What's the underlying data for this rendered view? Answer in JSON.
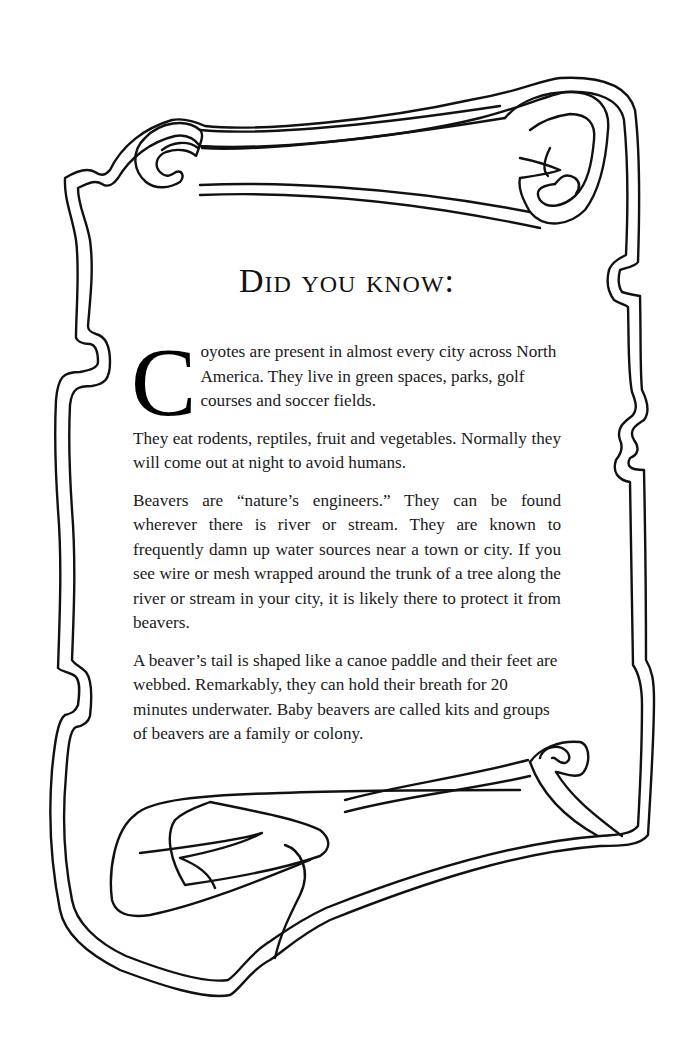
{
  "page": {
    "title": "Did you know:",
    "paragraphs": [
      {
        "dropcap": "C",
        "text": "oyotes are present in almost every city across North America. They live in green spaces, parks, golf courses and soccer fields."
      },
      {
        "text": "They eat rodents, reptiles, fruit and vegetables. Normally they will come out at night to avoid humans."
      },
      {
        "text": "Beavers are “nature’s engineers.” They can be found wherever there is river or stream. They are known to frequently damn up water sources near a town or city. If you see wire or mesh wrapped around the trunk of a tree along the river or stream in your city, it is likely there to protect it from beavers."
      },
      {
        "text": "A beaver’s tail is shaped like a canoe paddle and their feet are webbed. Remarkably, they can hold their breath for 20 minutes underwater. Baby beavers are called kits and groups of beavers are a family or colony."
      }
    ]
  },
  "decoration": {
    "frame": "parchment-scroll-outline",
    "stroke_color": "#111111",
    "background_color": "#ffffff"
  }
}
